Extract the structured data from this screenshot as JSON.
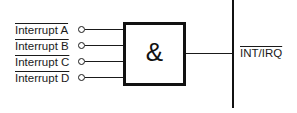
{
  "diagram": {
    "type": "logic-gate",
    "gate": {
      "symbol": "&",
      "function": "AND"
    },
    "inputs": [
      {
        "label": "Interrupt A",
        "inverted": true
      },
      {
        "label": "Interrupt B",
        "inverted": true
      },
      {
        "label": "Interrupt C",
        "inverted": true
      },
      {
        "label": "Interrupt D",
        "inverted": true
      }
    ],
    "output": {
      "label": "INT/IRQ",
      "overline": true
    },
    "colors": {
      "line": "#111111",
      "background": "#ffffff"
    }
  }
}
